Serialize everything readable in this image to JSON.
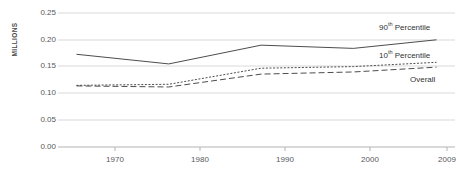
{
  "chart_data": {
    "type": "line",
    "title": "",
    "subtitle": "",
    "xlabel": "",
    "ylabel": "MILLIONS",
    "x": [
      1970,
      1980,
      1990,
      2000,
      2009
    ],
    "xtick_labels": [
      "1970",
      "1980",
      "1990",
      "2000",
      "2009"
    ],
    "ytick_labels": [
      "0.00",
      "0.05",
      "0.10",
      "0.15",
      "0.20",
      "0.25"
    ],
    "ytick_values": [
      0.0,
      0.05,
      0.1,
      0.15,
      0.2,
      0.25
    ],
    "xlim": [
      1968,
      2011
    ],
    "ylim": [
      0.0,
      0.25
    ],
    "grid": "horizontal",
    "legend_position": "inline-right",
    "series": [
      {
        "name": "90th Percentile",
        "label_html": "90<sup>th</sup> Percentile",
        "style": "solid",
        "color": "#4d4d4d",
        "values": [
          0.173,
          0.155,
          0.19,
          0.184,
          0.2
        ]
      },
      {
        "name": "10th Percentile",
        "label_html": "10<sup>th</sup> Percentile",
        "style": "dotted",
        "color": "#4d4d4d",
        "values": [
          0.115,
          0.117,
          0.147,
          0.15,
          0.158
        ]
      },
      {
        "name": "Overall",
        "label_html": "Overall",
        "style": "dashed",
        "color": "#4d4d4d",
        "values": [
          0.114,
          0.112,
          0.136,
          0.14,
          0.149
        ]
      }
    ]
  },
  "axis": {
    "y_title": "MILLIONS"
  },
  "ticks": {
    "y": [
      {
        "label": "0.25"
      },
      {
        "label": "0.20"
      },
      {
        "label": "0.15"
      },
      {
        "label": "0.10"
      },
      {
        "label": "0.05"
      },
      {
        "label": "0.00"
      }
    ],
    "x": [
      {
        "label": "1970"
      },
      {
        "label": "1980"
      },
      {
        "label": "1990"
      },
      {
        "label": "2000"
      },
      {
        "label": "2009"
      }
    ]
  },
  "labels": {
    "p90": "90th Percentile",
    "p10": "10th Percentile",
    "overall": "Overall"
  },
  "colors": {
    "gridline": "#d9d9d9",
    "line": "#4d4d4d",
    "text": "#58585a",
    "background": "#ffffff"
  }
}
